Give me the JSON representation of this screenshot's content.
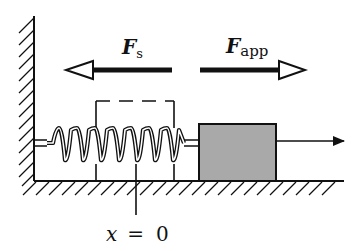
{
  "diagram": {
    "labels": {
      "spring_force_main": "F",
      "spring_force_sub": "s",
      "applied_force_main": "F",
      "applied_force_sub": "app",
      "equilibrium_x": "x",
      "equilibrium_eq": "=",
      "equilibrium_val": "0"
    },
    "colors": {
      "ink": "#111111",
      "block_fill": "#a9a9a9",
      "background": "#ffffff"
    },
    "elements": {
      "wall": "fixed wall (hatched)",
      "floor": "floor (hatched)",
      "spring": "stretched coil spring",
      "block": "gray block",
      "dashed_box": "equilibrium position outline",
      "motion_arrow": "displacement arrow"
    }
  }
}
